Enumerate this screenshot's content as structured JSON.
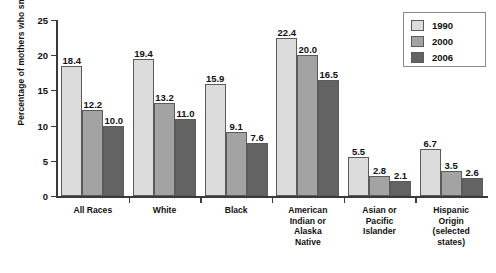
{
  "chart_data": {
    "type": "bar",
    "title": "",
    "xlabel": "",
    "ylabel": "Percentage of mothers who smoked",
    "ylim": [
      0,
      25
    ],
    "yticks": [
      "0",
      "5",
      "10",
      "15",
      "20",
      "25"
    ],
    "grid": false,
    "legend_position": "top-right",
    "categories": [
      "All Races",
      "White",
      "Black",
      "American Indian or Alaska Native",
      "Asian or Pacific Islander",
      "Hispanic Origin (selected states)"
    ],
    "category_label_lines": [
      [
        "All Races"
      ],
      [
        "White"
      ],
      [
        "Black"
      ],
      [
        "American",
        "Indian or",
        "Alaska",
        "Native"
      ],
      [
        "Asian or",
        "Pacific",
        "Islander"
      ],
      [
        "Hispanic",
        "Origin",
        "(selected",
        "states)"
      ]
    ],
    "series": [
      {
        "name": "1990",
        "color": "#dcdcdc",
        "values": [
          18.4,
          19.4,
          15.9,
          22.4,
          5.5,
          6.7
        ]
      },
      {
        "name": "2000",
        "color": "#a3a3a3",
        "values": [
          12.2,
          13.2,
          9.1,
          20.0,
          2.8,
          3.5
        ]
      },
      {
        "name": "2006",
        "color": "#636363",
        "values": [
          10.0,
          11.0,
          7.6,
          16.5,
          2.1,
          2.6
        ]
      }
    ],
    "value_labels": [
      [
        "18.4",
        "12.2",
        "10.0"
      ],
      [
        "19.4",
        "13.2",
        "11.0"
      ],
      [
        "15.9",
        "9.1",
        "7.6"
      ],
      [
        "22.4",
        "20.0",
        "16.5"
      ],
      [
        "5.5",
        "2.8",
        "2.1"
      ],
      [
        "6.7",
        "3.5",
        "2.6"
      ]
    ]
  },
  "legend": {
    "items": [
      {
        "label": "1990",
        "color": "#dcdcdc"
      },
      {
        "label": "2000",
        "color": "#a3a3a3"
      },
      {
        "label": "2006",
        "color": "#636363"
      }
    ]
  }
}
